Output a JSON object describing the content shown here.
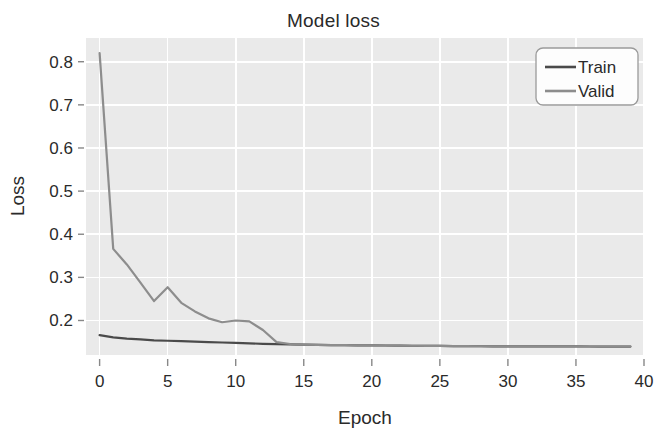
{
  "chart_data": {
    "type": "line",
    "title": "Model loss",
    "xlabel": "Epoch",
    "ylabel": "Loss",
    "xlim": [
      -1,
      40
    ],
    "ylim": [
      0.12,
      0.855
    ],
    "xticks": [
      0,
      5,
      10,
      15,
      20,
      25,
      30,
      35,
      40
    ],
    "xtick_labels": [
      "0",
      "5",
      "10",
      "15",
      "20",
      "25",
      "30",
      "35",
      "40"
    ],
    "yticks": [
      0.2,
      0.3,
      0.4,
      0.5,
      0.6,
      0.7,
      0.8
    ],
    "ytick_labels": [
      "0.2",
      "0.3",
      "0.4",
      "0.5",
      "0.6",
      "0.7",
      "0.8"
    ],
    "grid": true,
    "grid_color": "#ffffff",
    "plot_background": "#eaeaea",
    "figure_background": "#ffffff",
    "legend_position": "upper right",
    "x": [
      0,
      1,
      2,
      3,
      4,
      5,
      6,
      7,
      8,
      9,
      10,
      11,
      12,
      13,
      14,
      15,
      16,
      17,
      18,
      19,
      20,
      21,
      22,
      23,
      24,
      25,
      26,
      27,
      28,
      29,
      30,
      31,
      32,
      33,
      34,
      35,
      36,
      37,
      38,
      39
    ],
    "series": [
      {
        "name": "Train",
        "color": "#4a4a4a",
        "values": [
          0.166,
          0.161,
          0.158,
          0.156,
          0.154,
          0.153,
          0.152,
          0.151,
          0.15,
          0.149,
          0.148,
          0.147,
          0.146,
          0.145,
          0.1445,
          0.144,
          0.1435,
          0.143,
          0.1428,
          0.1425,
          0.1422,
          0.142,
          0.1418,
          0.1415,
          0.1412,
          0.141,
          0.1408,
          0.1405,
          0.1403,
          0.1402,
          0.1401,
          0.14,
          0.14,
          0.1399,
          0.1398,
          0.1398,
          0.1397,
          0.1396,
          0.1396,
          0.1395
        ]
      },
      {
        "name": "Valid",
        "color": "#8d8d8d",
        "values": [
          0.82,
          0.366,
          0.33,
          0.288,
          0.245,
          0.277,
          0.241,
          0.221,
          0.205,
          0.196,
          0.2,
          0.198,
          0.178,
          0.15,
          0.1455,
          0.1442,
          0.1435,
          0.143,
          0.1428,
          0.1425,
          0.1422,
          0.142,
          0.1418,
          0.1415,
          0.1412,
          0.141,
          0.1408,
          0.1405,
          0.1403,
          0.1402,
          0.1401,
          0.14,
          0.14,
          0.1399,
          0.1398,
          0.1398,
          0.1397,
          0.1396,
          0.1396,
          0.1395
        ]
      }
    ],
    "legend": [
      {
        "label": "Train",
        "color": "#4a4a4a"
      },
      {
        "label": "Valid",
        "color": "#8d8d8d"
      }
    ]
  }
}
